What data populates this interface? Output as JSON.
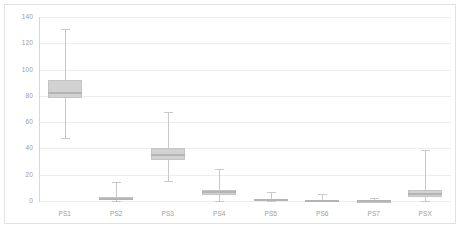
{
  "chart_data": {
    "type": "box",
    "title": "",
    "xlabel": "",
    "ylabel": "",
    "ylim": [
      0,
      140
    ],
    "yticks": [
      0,
      20,
      40,
      60,
      80,
      100,
      120,
      140
    ],
    "ytick_labels": [
      "0",
      "20",
      "40",
      "60",
      "80",
      "100",
      "120",
      "140"
    ],
    "grid": true,
    "legend": "none",
    "categories": [
      "PS1",
      "PS2",
      "PS3",
      "PS4",
      "PS5",
      "PS6",
      "PS7",
      "PSX"
    ],
    "boxes": [
      {
        "label": "PS1",
        "whisker_low": 48,
        "q1": 78,
        "median": 82,
        "q3": 92,
        "whisker_high": 131
      },
      {
        "label": "PS2",
        "whisker_low": 0,
        "q1": 0.5,
        "median": 1.5,
        "q3": 3,
        "whisker_high": 14.5
      },
      {
        "label": "PS3",
        "whisker_low": 15.5,
        "q1": 31,
        "median": 35,
        "q3": 40,
        "whisker_high": 68
      },
      {
        "label": "PS4",
        "whisker_low": 0,
        "q1": 4.5,
        "median": 6.5,
        "q3": 8.5,
        "whisker_high": 24.5
      },
      {
        "label": "PS5",
        "whisker_low": 0,
        "q1": 0,
        "median": 0.8,
        "q3": 1.5,
        "whisker_high": 6.5
      },
      {
        "label": "PS6",
        "whisker_low": 0,
        "q1": 0,
        "median": 0.3,
        "q3": 0.7,
        "whisker_high": 5.5
      },
      {
        "label": "PS7",
        "whisker_low": 0,
        "q1": 0,
        "median": 0.1,
        "q3": 0.3,
        "whisker_high": 2.5
      },
      {
        "label": "PSX",
        "whisker_low": 0,
        "q1": 3,
        "median": 5,
        "q3": 8.5,
        "whisker_high": 39
      }
    ],
    "colors": {
      "box_fill": "#d2d2d2",
      "box_border": "#c4c4c4",
      "median": "#b4b4b4",
      "whisker": "#c9c9c9",
      "gridline": "#ededed",
      "axis": "#d8d8d8",
      "tick_text": "#9d9d9d",
      "frame": "#e2e2e2",
      "background": "#ffffff"
    }
  }
}
